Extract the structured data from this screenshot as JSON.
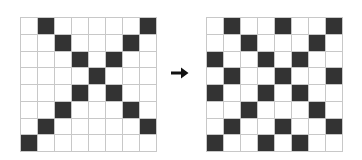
{
  "colors": {
    "filled": "#333333",
    "empty": "#ffffff",
    "gridline": "#c8c8c8",
    "arrow": "#111111"
  },
  "arrow_icon": "right-arrow-icon",
  "left_grid": {
    "rows": 8,
    "cols": 8,
    "filled": [
      [
        1,
        7
      ],
      [
        2,
        6
      ],
      [
        3,
        5
      ],
      [
        4
      ],
      [
        3,
        5
      ],
      [
        2,
        6
      ],
      [
        1,
        7
      ],
      [
        0
      ]
    ]
  },
  "right_grid": {
    "rows": 8,
    "cols": 8,
    "filled": [
      [
        1,
        4,
        7
      ],
      [
        2,
        6
      ],
      [
        0,
        3,
        5
      ],
      [
        1,
        4,
        7
      ],
      [
        0,
        3,
        5
      ],
      [
        2,
        6
      ],
      [
        1,
        4,
        7
      ],
      [
        0,
        3,
        5
      ]
    ]
  }
}
